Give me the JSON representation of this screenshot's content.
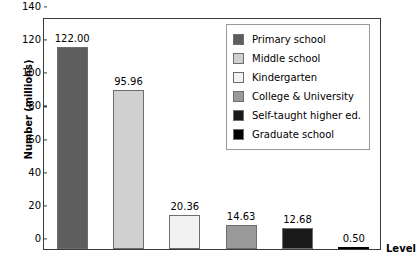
{
  "chart_data": {
    "type": "bar",
    "title": "",
    "xlabel": "Level",
    "ylabel": "Number (millions)",
    "ylim": [
      0,
      140
    ],
    "yticks": [
      0,
      20,
      40,
      60,
      80,
      100,
      120,
      140
    ],
    "ytick_labels": [
      "0",
      "20",
      "40",
      "60",
      "80",
      "100",
      "120",
      "140"
    ],
    "grid": false,
    "legend_position": "top-right",
    "categories": [
      "Primary school",
      "Middle school",
      "Kindergarten",
      "College & University",
      "Self-taught higher ed.",
      "Graduate school"
    ],
    "values": [
      122.0,
      95.96,
      20.36,
      14.63,
      12.68,
      0.5
    ],
    "value_labels": [
      "122.00",
      "95.96",
      "20.36",
      "14.63",
      "12.68",
      "0.50"
    ],
    "colors": [
      "#5e5e5e",
      "#d0d0d0",
      "#f2f2f2",
      "#9a9a9a",
      "#1a1a1a",
      "#000000"
    ]
  },
  "legend": {
    "items": [
      {
        "label": "Primary school",
        "color": "#5e5e5e"
      },
      {
        "label": "Middle school",
        "color": "#d0d0d0"
      },
      {
        "label": "Kindergarten",
        "color": "#f2f2f2"
      },
      {
        "label": "College & University",
        "color": "#9a9a9a"
      },
      {
        "label": "Self-taught higher ed.",
        "color": "#1a1a1a"
      },
      {
        "label": "Graduate school",
        "color": "#000000"
      }
    ]
  }
}
